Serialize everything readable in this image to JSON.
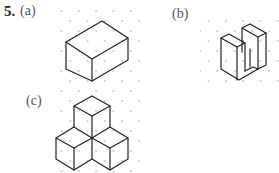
{
  "question": {
    "number": "5.",
    "parts": [
      {
        "label": "(a)",
        "figure": "isometric rectangular box drawn on dot grid"
      },
      {
        "label": "(b)",
        "figure": "isometric U-shaped block drawn on dot grid"
      },
      {
        "label": "(c)",
        "figure": "isometric arrangement of four cubes drawn on dot grid"
      }
    ]
  },
  "colors": {
    "edge": "#222222",
    "grid_dot": "#9a9a9a",
    "label": "#555555",
    "background": "#ffffff"
  }
}
